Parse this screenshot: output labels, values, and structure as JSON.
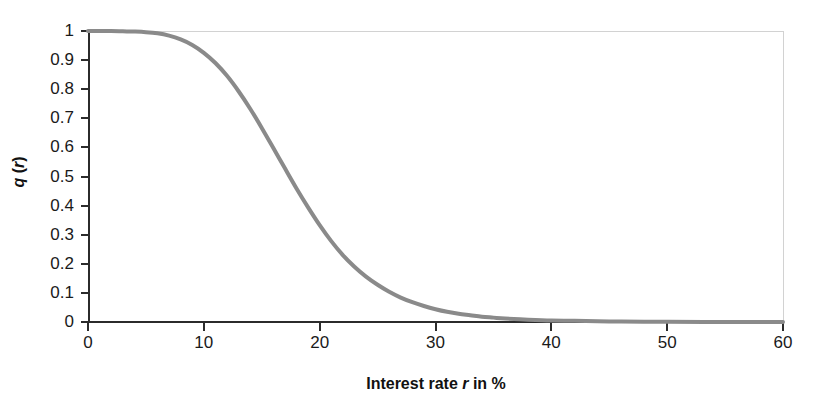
{
  "chart_data": {
    "type": "line",
    "title": "",
    "subtitle": "",
    "xlabel_parts": {
      "pre": "Interest rate ",
      "italic": "r",
      "post": " in %"
    },
    "xlabel": "Interest rate r in %",
    "ylabel_parts": {
      "pre": "q",
      "italic": "r",
      "open": " (",
      "close": ")"
    },
    "ylabel": "q (r)",
    "xlim": [
      0,
      60
    ],
    "ylim": [
      0,
      1
    ],
    "xticks": [
      0,
      10,
      20,
      30,
      40,
      50,
      60
    ],
    "xtick_labels": [
      "0",
      "10",
      "20",
      "30",
      "40",
      "50",
      "60"
    ],
    "yticks": [
      0,
      0.1,
      0.2,
      0.3,
      0.4,
      0.5,
      0.6,
      0.7,
      0.8,
      0.9,
      1
    ],
    "ytick_labels": [
      "0",
      "0.1",
      "0.2",
      "0.3",
      "0.4",
      "0.5",
      "0.6",
      "0.7",
      "0.8",
      "0.9",
      "1"
    ],
    "grid": false,
    "legend": null,
    "series": [
      {
        "name": "q(r)",
        "color": "#8a8a8a",
        "line_width": 4,
        "x": [
          0,
          1,
          2,
          3,
          4,
          5,
          6,
          7,
          8,
          9,
          10,
          11,
          12,
          13,
          14,
          15,
          16,
          17,
          18,
          19,
          20,
          21,
          22,
          23,
          24,
          25,
          26,
          27,
          28,
          29,
          30,
          31,
          32,
          33,
          34,
          35,
          36,
          38,
          40,
          42,
          45,
          48,
          50,
          55,
          60
        ],
        "values": [
          1.0,
          1.0,
          1.0,
          0.999,
          0.998,
          0.996,
          0.992,
          0.984,
          0.971,
          0.952,
          0.925,
          0.89,
          0.846,
          0.793,
          0.733,
          0.667,
          0.598,
          0.528,
          0.459,
          0.394,
          0.333,
          0.278,
          0.23,
          0.19,
          0.156,
          0.128,
          0.104,
          0.084,
          0.068,
          0.055,
          0.044,
          0.035,
          0.028,
          0.023,
          0.018,
          0.015,
          0.012,
          0.008,
          0.005,
          0.004,
          0.002,
          0.001,
          0.001,
          0.0,
          0.0
        ]
      }
    ]
  },
  "axes": {
    "frame_color": "#d2d2d2",
    "axis_color": "#2b2b2b",
    "background": "#ffffff"
  }
}
